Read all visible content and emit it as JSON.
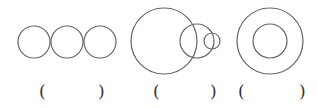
{
  "figures": [
    {
      "name": "three-tangent-circles",
      "circles": [
        {
          "cx": 34,
          "cy": 42,
          "r": 16
        },
        {
          "cx": 67,
          "cy": 42,
          "r": 16
        },
        {
          "cx": 100,
          "cy": 42,
          "r": 16
        }
      ],
      "answer": {
        "open": "(",
        "close": ")",
        "open_x": 39,
        "close_x": 98
      }
    },
    {
      "name": "three-intersecting-circles",
      "circles": [
        {
          "cx": 164,
          "cy": 41,
          "r": 33
        },
        {
          "cx": 197,
          "cy": 41,
          "r": 17
        },
        {
          "cx": 212,
          "cy": 41,
          "r": 8
        }
      ],
      "answer": {
        "open": "(",
        "close": ")",
        "open_x": 153,
        "close_x": 210
      }
    },
    {
      "name": "concentric-circles",
      "circles": [
        {
          "cx": 270,
          "cy": 41,
          "r": 33
        },
        {
          "cx": 270,
          "cy": 41,
          "r": 17
        }
      ],
      "answer": {
        "open": "(",
        "close": ")",
        "open_x": 238,
        "close_x": 299
      }
    }
  ],
  "style": {
    "stroke": "#666666",
    "stroke_width": 1.2
  }
}
